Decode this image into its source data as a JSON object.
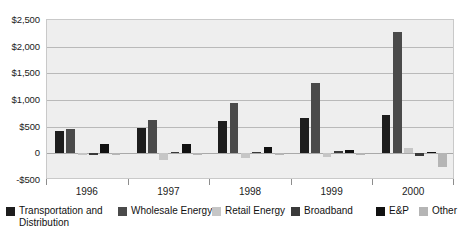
{
  "chart_data": {
    "type": "bar",
    "title": "",
    "subtitle": "",
    "xlabel": "",
    "ylabel": "",
    "categories": [
      "1996",
      "1997",
      "1998",
      "1999",
      "2000"
    ],
    "ylim": [
      -500,
      2500
    ],
    "ytick_values": [
      2500,
      2000,
      1500,
      1000,
      500,
      0,
      -500
    ],
    "ytick_labels": [
      "$2,500",
      "$2,000",
      "$1,500",
      "$1,000",
      "$500",
      "0",
      "-$500"
    ],
    "grid": true,
    "legend_position": "bottom",
    "series": [
      {
        "name": "Transportation and Distribution",
        "color": "#1d1d1d",
        "values": [
          420,
          480,
          600,
          660,
          720
        ]
      },
      {
        "name": "Wholesale Energy",
        "color": "#4a4a4a",
        "values": [
          450,
          620,
          950,
          1320,
          2280
        ]
      },
      {
        "name": "Retail Energy",
        "color": "#c6c6c6",
        "values": [
          0,
          -130,
          -90,
          -60,
          100
        ]
      },
      {
        "name": "Broadband",
        "color": "#3a3a3a",
        "values": [
          -10,
          20,
          30,
          40,
          -50
        ]
      },
      {
        "name": "E&P",
        "color": "#111111",
        "values": [
          180,
          170,
          110,
          70,
          30
        ]
      },
      {
        "name": "Other",
        "color": "#b5b5b5",
        "values": [
          -20,
          -30,
          -30,
          -20,
          -250
        ]
      }
    ]
  },
  "legend": {
    "items": [
      {
        "label": "Transportation and Distribution",
        "color": "#1d1d1d"
      },
      {
        "label": "Wholesale Energy",
        "color": "#4a4a4a"
      },
      {
        "label": "Retail Energy",
        "color": "#c6c6c6"
      },
      {
        "label": "Broadband",
        "color": "#3a3a3a"
      },
      {
        "label": "E&P",
        "color": "#111111"
      },
      {
        "label": "Other",
        "color": "#b5b5b5"
      }
    ]
  },
  "colors": {
    "plot_background": "#eeeeee",
    "plot_border": "#c9c9c9",
    "gridline": "#b9b9b9",
    "zero_line": "#a9a9a9",
    "text": "#1b1b1b",
    "page_background": "#ffffff"
  }
}
